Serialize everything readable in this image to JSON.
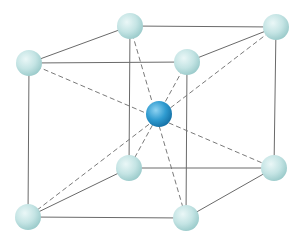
{
  "diagram": {
    "type": "body-centered-cubic-unit-cell",
    "colors": {
      "background": "#ffffff",
      "edge_line": "#6a6a6a",
      "diagonal_line": "#7a7a7a",
      "corner_atom_light": "#eaf7f7",
      "corner_atom_mid": "#c4e4e4",
      "corner_atom_dark": "#98c9c9",
      "center_atom_light": "#8fd3f2",
      "center_atom_mid": "#2f9bd0",
      "center_atom_dark": "#136ea3"
    },
    "atom_radius": 13,
    "corners": {
      "back_top_left": {
        "x": 130,
        "y": 26
      },
      "back_top_right": {
        "x": 276,
        "y": 27
      },
      "front_top_left": {
        "x": 29,
        "y": 63
      },
      "front_top_right": {
        "x": 187,
        "y": 62
      },
      "back_bottom_left": {
        "x": 129,
        "y": 168
      },
      "back_bottom_right": {
        "x": 274,
        "y": 168
      },
      "front_bottom_left": {
        "x": 28,
        "y": 217
      },
      "front_bottom_right": {
        "x": 186,
        "y": 218
      }
    },
    "center": {
      "x": 159,
      "y": 114
    },
    "edges": [
      [
        "back_top_left",
        "back_top_right"
      ],
      [
        "front_top_left",
        "front_top_right"
      ],
      [
        "back_top_left",
        "front_top_left"
      ],
      [
        "back_top_right",
        "front_top_right"
      ],
      [
        "back_bottom_left",
        "back_bottom_right"
      ],
      [
        "front_bottom_left",
        "front_bottom_right"
      ],
      [
        "back_bottom_left",
        "front_bottom_left"
      ],
      [
        "back_bottom_right",
        "front_bottom_right"
      ],
      [
        "back_top_left",
        "back_bottom_left"
      ],
      [
        "back_top_right",
        "back_bottom_right"
      ],
      [
        "front_top_left",
        "front_bottom_left"
      ],
      [
        "front_top_right",
        "front_bottom_right"
      ]
    ],
    "body_diagonals": [
      [
        "back_top_left",
        "front_bottom_right"
      ],
      [
        "back_top_right",
        "front_bottom_left"
      ],
      [
        "front_top_left",
        "back_bottom_right"
      ],
      [
        "front_top_right",
        "back_bottom_left"
      ]
    ]
  }
}
